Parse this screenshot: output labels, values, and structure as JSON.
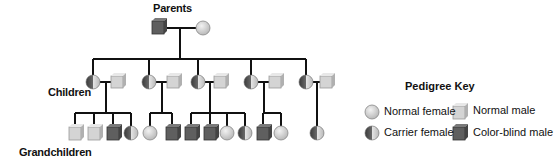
{
  "labels": {
    "parents": "Parents",
    "children": "Children",
    "grandchildren": "Grandchildren"
  },
  "key": {
    "title": "Pedigree Key",
    "items": [
      {
        "type": "normal_female",
        "label": "Normal female"
      },
      {
        "type": "carrier_female",
        "label": "Carrier female"
      },
      {
        "type": "normal_male",
        "label": "Normal male"
      },
      {
        "type": "colorblind_male",
        "label": "Color-blind male"
      }
    ]
  },
  "colors": {
    "light_fill": "#d4d4d4",
    "dark_fill": "#5f5f5f",
    "line": "#111111"
  },
  "pedigree": {
    "parents": [
      {
        "sex": "male",
        "phenotype": "color-blind male"
      },
      {
        "sex": "female",
        "phenotype": "normal female"
      }
    ],
    "children": [
      {
        "female": "carrier female",
        "spouse": "normal male",
        "offspring": [
          "normal male",
          "normal male",
          "color-blind male",
          "carrier female"
        ]
      },
      {
        "female": "carrier female",
        "spouse": "normal male",
        "offspring": [
          "normal female",
          "color-blind male"
        ]
      },
      {
        "female": "carrier female",
        "spouse": "normal male",
        "offspring": [
          "color-blind male",
          "color-blind male",
          "normal female",
          "carrier female"
        ]
      },
      {
        "female": "carrier female",
        "spouse": "normal male",
        "offspring": [
          "color-blind male",
          "normal female"
        ]
      },
      {
        "female": "carrier female",
        "spouse": "normal male",
        "offspring": [
          "carrier female"
        ]
      }
    ]
  }
}
